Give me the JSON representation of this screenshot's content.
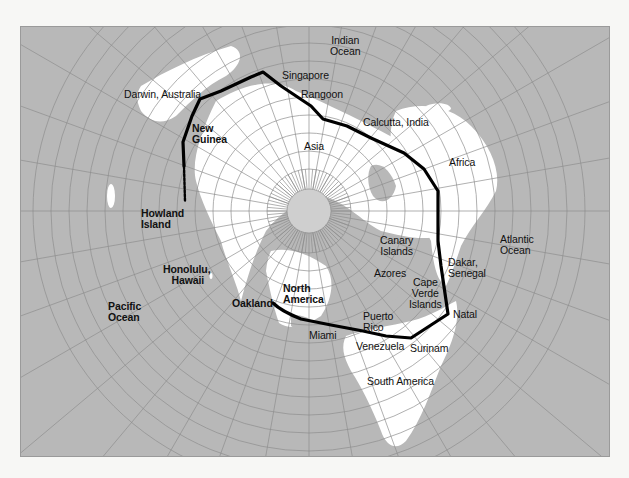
{
  "map": {
    "projection": "polar azimuthal",
    "colors": {
      "ocean": "#b8b8b8",
      "land": "#ffffff",
      "grid": "#8e8e8e",
      "route": "#000000",
      "background": "#f7f7f5"
    }
  },
  "labels": {
    "indian_ocean": "Indian\nOcean",
    "singapore": "Singapore",
    "rangoon": "Rangoon",
    "darwin": "Darwin, Australia",
    "new_guinea": "New\nGuinea",
    "calcutta": "Calcutta, India",
    "asia": "Asia",
    "africa": "Africa",
    "howland": "Howland\nIsland",
    "canary": "Canary\nIslands",
    "atlantic_ocean": "Atlantic\nOcean",
    "dakar": "Dakar,\nSenegal",
    "azores": "Azores",
    "honolulu": "Honolulu,\n   Hawaii",
    "cape_verde": "Cape\nVerde\nIslands",
    "north_america": "North\nAmerica",
    "oakland": "Oakland",
    "pacific_ocean": "Pacific\nOcean",
    "puerto_rico": "Puerto\nRico",
    "natal": "Natal",
    "miami": "Miami",
    "venezuela": "Venezuela",
    "surinam": "Surinam",
    "south_america": "South America"
  },
  "route": {
    "stops": [
      "Oakland",
      "Miami",
      "Puerto Rico",
      "Venezuela",
      "Surinam",
      "Natal",
      "Dakar, Senegal",
      "Africa",
      "Calcutta, India",
      "Rangoon",
      "Singapore",
      "Darwin, Australia",
      "New Guinea",
      "Howland Island"
    ],
    "final_leg_style": "dashed"
  }
}
